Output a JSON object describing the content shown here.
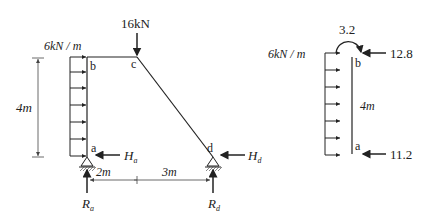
{
  "left_frame": {
    "load_label": "6kN / m",
    "point_load_label": "16kN",
    "height_label": "4m",
    "nodes": {
      "a": "a",
      "b": "b",
      "c": "c",
      "d": "d"
    },
    "reactions": {
      "Ha": {
        "main": "H",
        "sub": "a"
      },
      "Hd": {
        "main": "H",
        "sub": "d"
      },
      "Ra": {
        "main": "R",
        "sub": "a"
      },
      "Rd": {
        "main": "R",
        "sub": "d"
      }
    },
    "span_labels": [
      "2m",
      "3m"
    ]
  },
  "right_fbd": {
    "load_label": "6kN / m",
    "moment_label": "3.2",
    "top_force_label": "12.8",
    "bottom_force_label": "11.2",
    "length_label": "4m",
    "nodes": {
      "a": "a",
      "b": "b"
    }
  },
  "colors": {
    "line": "#222222",
    "dim": "#555555",
    "background": "#ffffff"
  }
}
